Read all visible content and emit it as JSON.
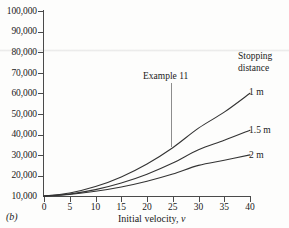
{
  "figure": {
    "panel_label": "(b)",
    "axis_title_main": "Initial velocity,",
    "axis_title_var": "v",
    "annotation": "Example 11",
    "legend_header_line1": "Stopping",
    "legend_header_line2": "distance",
    "colors": {
      "axis": "#4a4a4a",
      "curve": "#333333",
      "leader": "#8d8d8d",
      "text": "#1a1a1a",
      "background": "#fdfdfc"
    }
  },
  "chart_data": {
    "type": "line",
    "title": "",
    "subtitle": "",
    "xlabel": "Initial velocity, v",
    "ylabel": "",
    "xlim": [
      0,
      40
    ],
    "ylim": [
      10000,
      100000
    ],
    "grid": false,
    "legend_position": "right-of-curve-ends",
    "xticks": [
      0,
      5,
      10,
      15,
      20,
      25,
      30,
      35,
      40
    ],
    "xticklabels": [
      "0",
      "5",
      "10",
      "15",
      "20",
      "25",
      "30",
      "35",
      "40"
    ],
    "yticks": [
      10000,
      20000,
      30000,
      40000,
      50000,
      60000,
      70000,
      80000,
      90000,
      100000
    ],
    "yticklabels": [
      "10,000",
      "20,000",
      "30,000",
      "40,000",
      "50,000",
      "60,000",
      "70,000",
      "80,000",
      "90,000",
      "100,000"
    ],
    "x": [
      0,
      5,
      10,
      15,
      20,
      25,
      30,
      35,
      40
    ],
    "series": [
      {
        "name": "1 m",
        "label": "1 m",
        "values": [
          10000,
          11500,
          14600,
          19300,
          25600,
          33500,
          43000,
          50800,
          60000
        ]
      },
      {
        "name": "1.5 m",
        "label": "1.5 m",
        "values": [
          10000,
          11000,
          13100,
          16300,
          20600,
          26000,
          32500,
          37100,
          42000
        ]
      },
      {
        "name": "2 m",
        "label": "2 m",
        "values": [
          10000,
          10800,
          12300,
          14400,
          17200,
          20700,
          24900,
          27400,
          30000
        ]
      }
    ],
    "annotations": [
      {
        "text": "Example 11",
        "x": 25,
        "y_text": 88000,
        "leader_to_y": 33500
      }
    ]
  }
}
